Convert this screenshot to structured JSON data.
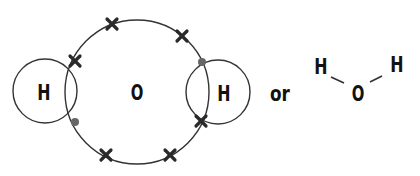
{
  "diagram": {
    "type": "dot-and-cross covalent bonding",
    "molecule": "water",
    "atoms": {
      "oxygen": "O",
      "hydrogen_left": "H",
      "hydrogen_right": "H"
    },
    "connector": "or",
    "structural_formula": {
      "left": "H",
      "center": "O",
      "right": "H"
    },
    "colors": {
      "line": "#333333",
      "cross": "#2a2a2a",
      "dot": "#666666",
      "text": "#111111"
    }
  }
}
